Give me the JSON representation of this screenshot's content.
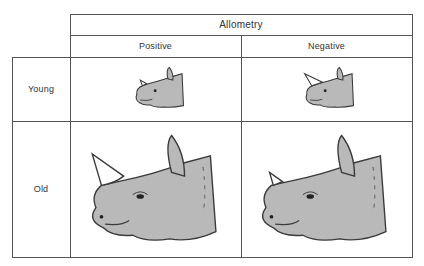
{
  "header": {
    "title": "Allometry",
    "columns": [
      "Positive",
      "Negative"
    ]
  },
  "rows": [
    {
      "label": "Young"
    },
    {
      "label": "Old"
    }
  ],
  "cells": [
    {
      "row": "Young",
      "column": "Positive",
      "figure": "rhino-head",
      "size": "small",
      "horn": "small"
    },
    {
      "row": "Young",
      "column": "Negative",
      "figure": "rhino-head",
      "size": "small",
      "horn": "medium"
    },
    {
      "row": "Old",
      "column": "Positive",
      "figure": "rhino-head",
      "size": "large",
      "horn": "large"
    },
    {
      "row": "Old",
      "column": "Negative",
      "figure": "rhino-head",
      "size": "large",
      "horn": "small"
    }
  ],
  "colors": {
    "skin": "#b9b9b9",
    "outline": "#3a3a3a",
    "horn": "#ffffff",
    "grid": "#555555"
  }
}
